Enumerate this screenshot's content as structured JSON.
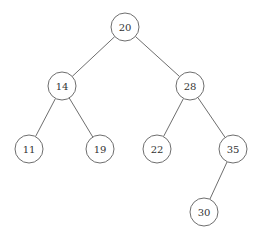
{
  "diagram": {
    "type": "binary-search-tree",
    "node_radius": 14,
    "colors": {
      "stroke": "#6e6e6e",
      "text": "#333333",
      "background": "#ffffff"
    },
    "nodes": [
      {
        "id": "n20",
        "label": "20",
        "x": 125,
        "y": 27
      },
      {
        "id": "n14",
        "label": "14",
        "x": 62,
        "y": 86
      },
      {
        "id": "n28",
        "label": "28",
        "x": 190,
        "y": 86
      },
      {
        "id": "n11",
        "label": "11",
        "x": 29,
        "y": 149
      },
      {
        "id": "n19",
        "label": "19",
        "x": 100,
        "y": 149
      },
      {
        "id": "n22",
        "label": "22",
        "x": 157,
        "y": 149
      },
      {
        "id": "n35",
        "label": "35",
        "x": 233,
        "y": 149
      },
      {
        "id": "n30",
        "label": "30",
        "x": 204,
        "y": 212
      }
    ],
    "edges": [
      {
        "from": "n20",
        "to": "n14"
      },
      {
        "from": "n20",
        "to": "n28"
      },
      {
        "from": "n14",
        "to": "n11"
      },
      {
        "from": "n14",
        "to": "n19"
      },
      {
        "from": "n28",
        "to": "n22"
      },
      {
        "from": "n28",
        "to": "n35"
      },
      {
        "from": "n35",
        "to": "n30"
      }
    ]
  }
}
